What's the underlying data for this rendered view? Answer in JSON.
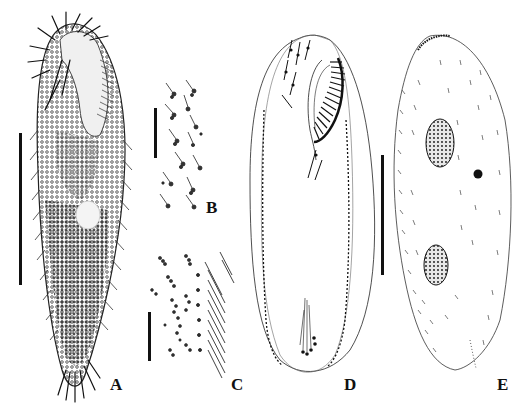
{
  "figure": {
    "panels": [
      {
        "id": "A",
        "label": "A",
        "content": "ventral view in vivo, cell packed with granules, dense cirri"
      },
      {
        "id": "B",
        "label": "B",
        "content": "cortical granules around dorsal bristles"
      },
      {
        "id": "C",
        "label": "C",
        "content": "cortical granules near marginal cirri"
      },
      {
        "id": "D",
        "label": "D",
        "content": "ventral infraciliature, adoral zone and marginal rows"
      },
      {
        "id": "E",
        "label": "E",
        "content": "dorsal view showing dorsal kineties, two macronuclear nodules, one micronucleus"
      }
    ],
    "scale_bars": [
      {
        "panel": "A",
        "orientation": "vertical"
      },
      {
        "panel": "B",
        "orientation": "vertical"
      },
      {
        "panel": "C",
        "orientation": "vertical"
      },
      {
        "panel": "D-E",
        "orientation": "vertical"
      }
    ],
    "colors": {
      "ink": "#111111",
      "background": "#ffffff",
      "stipple": "#555555"
    }
  }
}
